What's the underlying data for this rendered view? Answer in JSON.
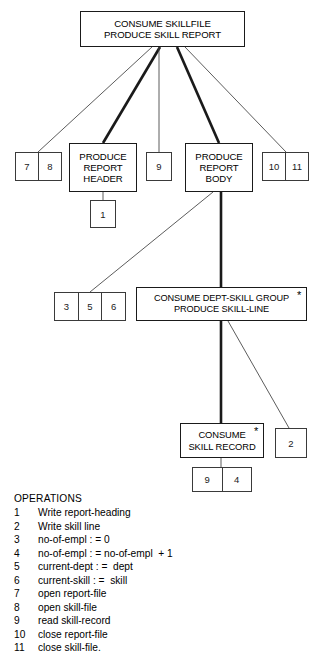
{
  "diagram": {
    "type": "jackson-structure-diagram",
    "processes": [
      {
        "id": "root",
        "label": "CONSUME SKILLFILE\nPRODUCE SKILL REPORT",
        "x": 80,
        "y": 11,
        "w": 165,
        "h": 36,
        "font_size": 9.6,
        "iteration_marker": ""
      },
      {
        "id": "report-header",
        "label": "PRODUCE\nREPORT\nHEADER",
        "x": 69,
        "y": 143,
        "w": 68,
        "h": 49,
        "font_size": 9.6,
        "iteration_marker": ""
      },
      {
        "id": "report-body",
        "label": "PRODUCE\nREPORT\nBODY",
        "x": 185,
        "y": 143,
        "w": 68,
        "h": 49,
        "font_size": 9.6,
        "iteration_marker": ""
      },
      {
        "id": "dept-skill-group",
        "label": "CONSUME DEPT-SKILL GROUP\nPRODUCE SKILL-LINE",
        "x": 136,
        "y": 287,
        "w": 171,
        "h": 34,
        "font_size": 9.2,
        "iteration_marker": "*"
      },
      {
        "id": "skill-record",
        "label": "CONSUME\nSKILL RECORD",
        "x": 180,
        "y": 423,
        "w": 84,
        "h": 35,
        "font_size": 9.4,
        "iteration_marker": "*"
      }
    ],
    "operation_boxes": [
      {
        "id": "ops-7-8",
        "cells": [
          "7",
          "8"
        ],
        "x": 15,
        "y": 152,
        "w": 47,
        "h": 29
      },
      {
        "id": "ops-9-top",
        "cells": [
          "9"
        ],
        "x": 146,
        "y": 152,
        "w": 26,
        "h": 29
      },
      {
        "id": "ops-10-11",
        "cells": [
          "10",
          "11"
        ],
        "x": 262,
        "y": 152,
        "w": 47,
        "h": 29
      },
      {
        "id": "ops-1",
        "cells": [
          "1"
        ],
        "x": 90,
        "y": 200,
        "w": 26,
        "h": 28
      },
      {
        "id": "ops-3-5-6",
        "cells": [
          "3",
          "5",
          "6"
        ],
        "x": 54,
        "y": 292,
        "w": 72,
        "h": 29
      },
      {
        "id": "ops-2",
        "cells": [
          "2"
        ],
        "x": 275,
        "y": 428,
        "w": 32,
        "h": 30
      },
      {
        "id": "ops-9-4",
        "cells": [
          "9",
          "4"
        ],
        "x": 192,
        "y": 467,
        "w": 60,
        "h": 25
      }
    ],
    "connectors": [
      {
        "id": "root-to-ops78",
        "from": [
          152,
          47
        ],
        "to": [
          38,
          152
        ],
        "weight": "thin"
      },
      {
        "id": "root-to-header",
        "from": [
          160,
          47
        ],
        "to": [
          103,
          143
        ],
        "weight": "thick"
      },
      {
        "id": "root-to-ops9",
        "from": [
          159,
          47
        ],
        "to": [
          159,
          152
        ],
        "weight": "thin"
      },
      {
        "id": "root-to-body",
        "from": [
          177,
          47
        ],
        "to": [
          219,
          143
        ],
        "weight": "thick"
      },
      {
        "id": "root-to-ops1011",
        "from": [
          185,
          47
        ],
        "to": [
          286,
          152
        ],
        "weight": "thin"
      },
      {
        "id": "header-to-ops1",
        "from": [
          103,
          192
        ],
        "to": [
          103,
          200
        ],
        "weight": "thin"
      },
      {
        "id": "body-to-ops356",
        "from": [
          213,
          192
        ],
        "to": [
          90,
          292
        ],
        "weight": "thin"
      },
      {
        "id": "body-to-group",
        "from": [
          221,
          192
        ],
        "to": [
          221,
          287
        ],
        "weight": "thick"
      },
      {
        "id": "group-to-skillrec",
        "from": [
          221,
          321
        ],
        "to": [
          221,
          423
        ],
        "weight": "thick"
      },
      {
        "id": "group-to-ops2",
        "from": [
          228,
          321
        ],
        "to": [
          289,
          428
        ],
        "weight": "thin"
      },
      {
        "id": "skillrec-to-ops94",
        "from": [
          221,
          458
        ],
        "to": [
          221,
          467
        ],
        "weight": "thin"
      }
    ]
  },
  "legend": {
    "title": "OPERATIONS",
    "items": [
      {
        "num": "1",
        "text": "Write report-heading"
      },
      {
        "num": "2",
        "text": "Write skill line"
      },
      {
        "num": "3",
        "text": "no-of-empl : = 0"
      },
      {
        "num": "4",
        "text": "no-of-empl : = no-of-empl  + 1"
      },
      {
        "num": "5",
        "text": "current-dept : =  dept"
      },
      {
        "num": "6",
        "text": "current-skill : =  skill"
      },
      {
        "num": "7",
        "text": "open report-file"
      },
      {
        "num": "8",
        "text": "open skill-file"
      },
      {
        "num": "9",
        "text": "read skill-record"
      },
      {
        "num": "10",
        "text": "close report-file"
      },
      {
        "num": "11",
        "text": "close skill-file."
      }
    ]
  },
  "colors": {
    "stroke": "#1a1a1a",
    "thin_stroke": "#4a4a4a",
    "background": "#ffffff"
  }
}
